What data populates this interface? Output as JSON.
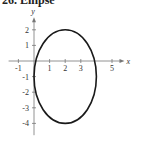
{
  "chart_data": {
    "type": "line",
    "title": "26. Ellipse",
    "xlabel": "x",
    "ylabel": "y",
    "xlim": [
      -1.5,
      5.8
    ],
    "ylim": [
      -4.5,
      2.8
    ],
    "x_ticks": [
      -1,
      1,
      2,
      3,
      5
    ],
    "y_ticks": [
      2,
      1,
      -1,
      -2,
      -3,
      -4
    ],
    "grid": false,
    "series": [
      {
        "name": "ellipse",
        "shape": "ellipse",
        "center": [
          2,
          -1
        ],
        "semi_axis_x": 2,
        "semi_axis_y": 3,
        "color": "#1a1a1a"
      }
    ]
  }
}
